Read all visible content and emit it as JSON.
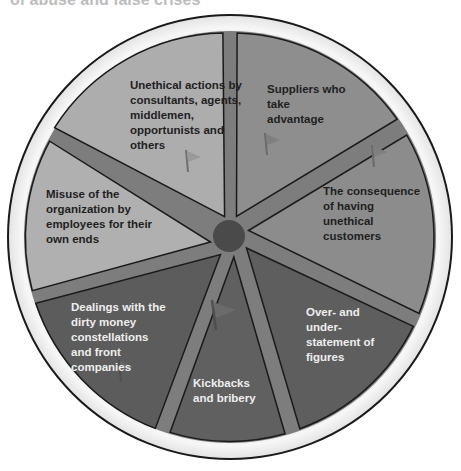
{
  "header": {
    "title_partial": "of abuse and false crises"
  },
  "footer": {
    "caption_partial": ""
  },
  "diagram": {
    "type": "segmented-wheel",
    "center_hub": "",
    "colors": {
      "ring": "#e8e8e8",
      "outline": "#1a1a1a",
      "light_segment": "#a9a9a9",
      "mid_segment": "#8a8a8a",
      "dark_segment": "#5f5f5f",
      "spoke": "#7a7a7a",
      "hub": "#4a4a4a"
    },
    "segments": [
      {
        "label": "Unethical actions by consultants, agents, middlemen, opportunists and others",
        "shade": "light",
        "has_flag": true
      },
      {
        "label": "Suppliers who take advantage",
        "shade": "mid",
        "has_flag": true
      },
      {
        "label": "The consequence of having unethical customers",
        "shade": "mid",
        "has_flag": true
      },
      {
        "label": "Over- and under-statement of figures",
        "shade": "dark",
        "has_flag": false
      },
      {
        "label": "Kickbacks and bribery",
        "shade": "dark",
        "has_flag": true
      },
      {
        "label": "Dealings with the dirty money constellations and front companies",
        "shade": "dark",
        "has_flag": true
      },
      {
        "label": "Misuse of the organization by employees for their own ends",
        "shade": "light",
        "has_flag": false
      }
    ]
  }
}
